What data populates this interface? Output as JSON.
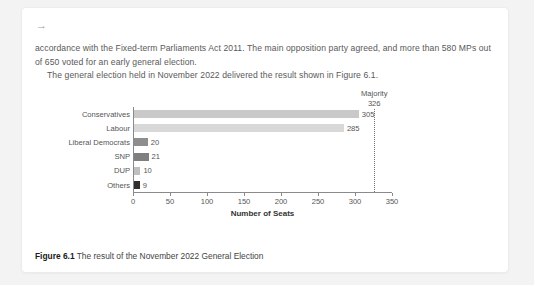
{
  "card": {
    "arrow_icon": "→"
  },
  "body": {
    "paragraphs": [
      "accordance with the Fixed-term Parliaments Act 2011. The main opposition party agreed, and more than 580 MPs out of 650 voted for an early general election.",
      "The general election held in November 2022 delivered the result shown in Figure 6.1."
    ]
  },
  "caption": {
    "label": "Figure 6.1",
    "text": "The result of the November 2022 General Election"
  },
  "chart_data": {
    "type": "bar",
    "orientation": "horizontal",
    "title": "",
    "xlabel": "Number of Seats",
    "ylabel": "",
    "xlim": [
      0,
      350
    ],
    "xticks": [
      0,
      50,
      100,
      150,
      200,
      250,
      300,
      350
    ],
    "grid": false,
    "legend": "none",
    "categories": [
      "Conservatives",
      "Labour",
      "Liberal Democrats",
      "SNP",
      "DUP",
      "Others"
    ],
    "values": [
      305,
      285,
      20,
      21,
      10,
      9
    ],
    "value_labels": [
      "305",
      "285",
      "20",
      "21",
      "10",
      "9"
    ],
    "bar_colors": [
      "#c9c9c9",
      "#d8d8d8",
      "#8e8e8e",
      "#7f7f7f",
      "#bfbfbf",
      "#2e2e2e"
    ],
    "annotations": [
      {
        "name": "majority",
        "label_line1": "Majority",
        "label_line2": "326",
        "value": 326,
        "style": "dotted-vertical-line"
      }
    ]
  }
}
